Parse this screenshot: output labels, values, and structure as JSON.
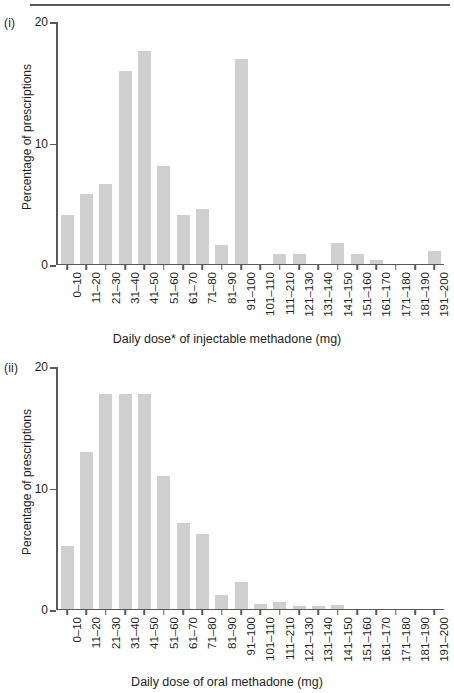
{
  "figure": {
    "top_rule": true,
    "bar_color": "#cfcfcf",
    "axis_color": "#58595b",
    "text_color": "#231f20"
  },
  "panels": [
    {
      "label": "(i)",
      "y_axis_title": "Percentage of prescriptions",
      "x_axis_title": "Daily dose* of injectable methadone (mg)",
      "y_ticks": [
        "0",
        "10",
        "20"
      ]
    },
    {
      "label": "(ii)",
      "y_axis_title": "Percentage of prescriptions",
      "x_axis_title": "Daily dose of oral methadone (mg)",
      "y_ticks": [
        "0",
        "10",
        "20"
      ]
    }
  ],
  "chart_data": [
    {
      "type": "bar",
      "title": "(i)",
      "xlabel": "Daily dose* of injectable methadone (mg)",
      "ylabel": "Percentage of prescriptions",
      "ylim": [
        0,
        20
      ],
      "yticks": [
        0,
        10,
        20
      ],
      "grid": false,
      "legend": "none",
      "categories": [
        "0–10",
        "11–20",
        "21–30",
        "31–40",
        "41–50",
        "51–60",
        "61–70",
        "71–80",
        "81–90",
        "91–100",
        "101–110",
        "111–210",
        "121–130",
        "131–140",
        "141–150",
        "151–160",
        "161–170",
        "171–180",
        "181–190",
        "191–200"
      ],
      "values": [
        4.0,
        5.8,
        6.6,
        16.0,
        17.6,
        8.1,
        4.0,
        4.5,
        1.5,
        17.0,
        0,
        0.8,
        0.8,
        0,
        1.7,
        0.8,
        0.3,
        0,
        0,
        1.0
      ]
    },
    {
      "type": "bar",
      "title": "(ii)",
      "xlabel": "Daily dose of oral methadone (mg)",
      "ylabel": "Percentage of prescriptions",
      "ylim": [
        0,
        20
      ],
      "yticks": [
        0,
        10,
        20
      ],
      "grid": false,
      "legend": "none",
      "categories": [
        "0–10",
        "11–20",
        "21–30",
        "31–40",
        "41–50",
        "51–60",
        "61–70",
        "71–80",
        "81–90",
        "91–100",
        "101–110",
        "111–210",
        "121–130",
        "131–140",
        "141–150",
        "151–160",
        "161–170",
        "171–180",
        "181–190",
        "191–200"
      ],
      "values": [
        5.2,
        13.0,
        17.8,
        17.8,
        17.8,
        11.0,
        7.1,
        6.2,
        1.1,
        2.2,
        0.35,
        0.5,
        0.25,
        0.25,
        0.3,
        0,
        0,
        0,
        0,
        0
      ]
    }
  ]
}
